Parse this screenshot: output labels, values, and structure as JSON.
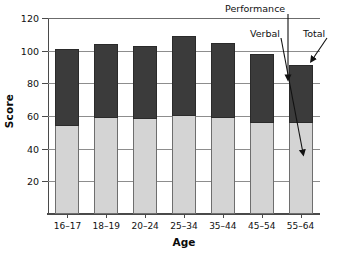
{
  "chart_data": {
    "type": "bar",
    "subtype": "stacked-bar",
    "title": "",
    "xlabel": "Age",
    "ylabel": "Score",
    "categories": [
      "16–17",
      "18–19",
      "20–24",
      "25–34",
      "35–44",
      "45–54",
      "55–64"
    ],
    "series": [
      {
        "name": "Verbal",
        "values": [
          54,
          59,
          58,
          60,
          59,
          56,
          56
        ],
        "color": "#d4d4d4"
      },
      {
        "name": "Performance",
        "values": [
          47,
          45,
          45,
          49,
          46,
          42,
          35
        ],
        "color": "#3b3b3b"
      }
    ],
    "totals": [
      101,
      104,
      103,
      109,
      105,
      98,
      91
    ],
    "ylim": [
      0,
      120
    ],
    "yticks": [
      20,
      40,
      60,
      80,
      100,
      120
    ],
    "ytick_labels": [
      "20",
      "40",
      "60",
      "80",
      "100",
      "120"
    ],
    "grid": "horizontal",
    "legend": "none",
    "annotations": [
      {
        "label": "Performance",
        "target": "dark-segment-of-55-64-bar"
      },
      {
        "label": "Verbal",
        "target": "light-segment-of-55-64-bar"
      },
      {
        "label": "Total",
        "target": "top-of-55-64-bar"
      }
    ]
  },
  "axes": {
    "y_title": "Score",
    "x_title": "Age"
  },
  "annotations": {
    "performance": "Performance",
    "verbal": "Verbal",
    "total": "Total"
  }
}
